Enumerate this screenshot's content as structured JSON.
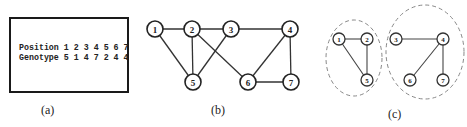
{
  "panel_a": {
    "caption": "(a)",
    "row1": {
      "label": "Position",
      "values": [
        "1",
        "2",
        "3",
        "4",
        "5",
        "6",
        "7"
      ]
    },
    "row2": {
      "label": "Genotype",
      "values": [
        "5",
        "1",
        "4",
        "7",
        "2",
        "4",
        "4"
      ]
    },
    "line1": "Position 1 2 3 4 5 6 7",
    "line2": "Genotype 5 1 4 7 2 4 4"
  },
  "panel_b": {
    "caption": "(b)",
    "nodes": [
      {
        "id": "1",
        "x": 155,
        "y": 29
      },
      {
        "id": "2",
        "x": 192,
        "y": 29
      },
      {
        "id": "3",
        "x": 231,
        "y": 29
      },
      {
        "id": "4",
        "x": 290,
        "y": 29
      },
      {
        "id": "5",
        "x": 193,
        "y": 82
      },
      {
        "id": "6",
        "x": 248,
        "y": 82
      },
      {
        "id": "7",
        "x": 291,
        "y": 82
      }
    ],
    "edges": [
      [
        "1",
        "2"
      ],
      [
        "2",
        "3"
      ],
      [
        "3",
        "4"
      ],
      [
        "1",
        "5"
      ],
      [
        "2",
        "5"
      ],
      [
        "3",
        "5"
      ],
      [
        "2",
        "6"
      ],
      [
        "4",
        "6"
      ],
      [
        "4",
        "7"
      ],
      [
        "6",
        "7"
      ]
    ]
  },
  "panel_c": {
    "caption": "(c)",
    "clusters": [
      {
        "name": "cluster-1",
        "ellipse": {
          "cx": 354,
          "cy": 58,
          "rx": 28,
          "ry": 38
        },
        "nodes": [
          {
            "id": "1",
            "x": 339,
            "y": 39
          },
          {
            "id": "2",
            "x": 367,
            "y": 39
          },
          {
            "id": "5",
            "x": 367,
            "y": 80
          }
        ],
        "edges": [
          [
            "1",
            "2"
          ],
          [
            "1",
            "5"
          ],
          [
            "2",
            "5"
          ]
        ]
      },
      {
        "name": "cluster-2",
        "ellipse": {
          "cx": 425,
          "cy": 52,
          "rx": 39,
          "ry": 47
        },
        "nodes": [
          {
            "id": "3",
            "x": 396,
            "y": 39
          },
          {
            "id": "4",
            "x": 443,
            "y": 39
          },
          {
            "id": "6",
            "x": 410,
            "y": 80
          },
          {
            "id": "7",
            "x": 443,
            "y": 80
          }
        ],
        "edges": [
          [
            "3",
            "4"
          ],
          [
            "4",
            "6"
          ],
          [
            "4",
            "7"
          ]
        ]
      }
    ]
  }
}
